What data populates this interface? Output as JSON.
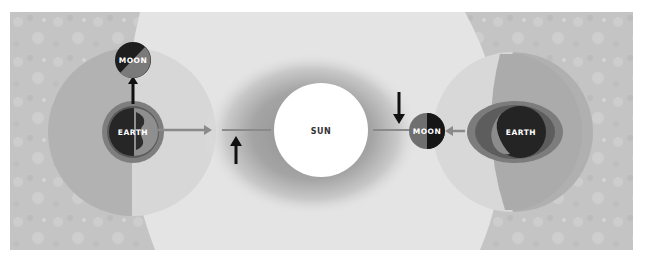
{
  "diagram": {
    "type": "tides-illustration",
    "style": "grayscale",
    "colors": {
      "background_texture": "#c6c6c6",
      "sunlit_region": "#e6e6e6",
      "sun_glow": "#a8a8a8",
      "sun": "#ffffff",
      "tidal_bulge_outer": "#b0b0b0",
      "earth_dark": "#2a2a2a",
      "earth_light": "#8a8a8a",
      "moon_dark": "#1e1e1e",
      "moon_light": "#7a7a7a",
      "arrow_gray": "#8c8c8c",
      "arrow_black": "#111111"
    },
    "sun": {
      "label": "SUN"
    },
    "left_system": {
      "earth_label": "EARTH",
      "moon_label": "MOON",
      "moon_position": "above-earth",
      "arrow_earth_to_moon": "up",
      "arrow_earth_to_sun": "right"
    },
    "right_system": {
      "earth_label": "EARTH",
      "moon_label": "MOON",
      "moon_position": "left-of-earth-toward-sun",
      "arrow_earth_to_moon": "left"
    },
    "center_arrows": [
      {
        "position": "left-of-sun",
        "direction": "up"
      },
      {
        "position": "right-of-sun",
        "direction": "down"
      }
    ]
  }
}
